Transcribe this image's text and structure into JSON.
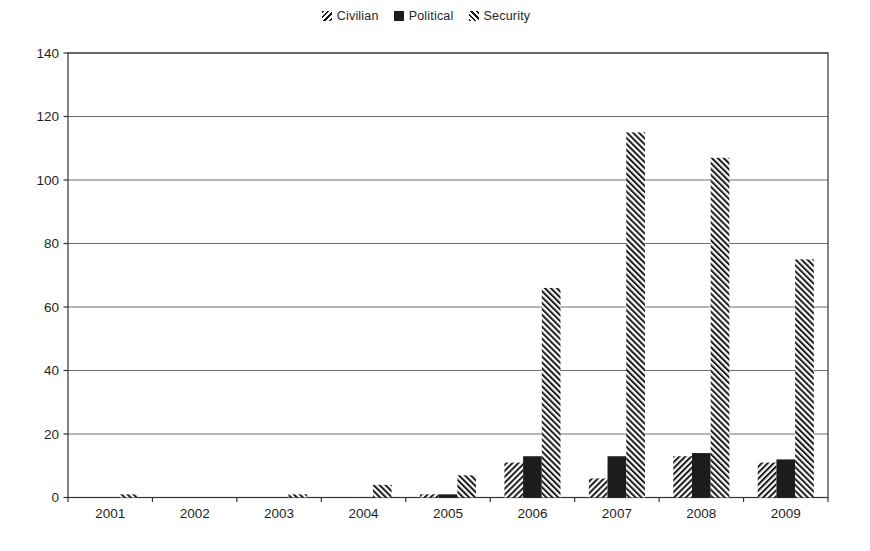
{
  "chart_data": {
    "type": "bar",
    "title": "",
    "xlabel": "",
    "ylabel": "",
    "categories": [
      "2001",
      "2002",
      "2003",
      "2004",
      "2005",
      "2006",
      "2007",
      "2008",
      "2009"
    ],
    "series": [
      {
        "name": "Civilian",
        "fill": "hatch-forward",
        "values": [
          0,
          0,
          0,
          0,
          1,
          11,
          6,
          13,
          11
        ]
      },
      {
        "name": "Political",
        "fill": "solid-black",
        "values": [
          0,
          0,
          0,
          0,
          1,
          13,
          13,
          14,
          12
        ]
      },
      {
        "name": "Security",
        "fill": "hatch-backward",
        "values": [
          1,
          0,
          1,
          4,
          7,
          66,
          115,
          107,
          75
        ]
      }
    ],
    "ylim": [
      0,
      140
    ],
    "yticks": [
      0,
      20,
      40,
      60,
      80,
      100,
      120,
      140
    ],
    "grid": true,
    "legend_position": "top-center",
    "colors": {
      "bar_black": "#1c1c1c",
      "hatch_stroke": "#1c1c1c",
      "grid_line": "#6e6e6e",
      "axis_line": "#333333",
      "text": "#1f1f1f",
      "background": "#ffffff"
    }
  }
}
